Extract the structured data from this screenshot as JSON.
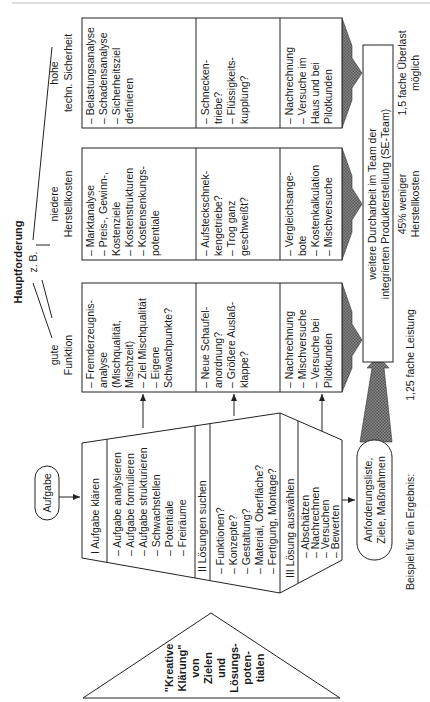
{
  "header": {
    "title": "Hauptforderung",
    "subtitle": "z. B."
  },
  "columns": [
    {
      "heading": [
        "hohe",
        "techn. Sicherheit"
      ],
      "row1": [
        "– Belastungsanalyse",
        "– Schadensanalyse",
        "– Sicherheitsziel",
        "   definieren"
      ],
      "row2": [
        "– Schnecken-",
        "   triebe?",
        "– Flüssigkeits-",
        "   kupplung?"
      ],
      "row3": [
        "– Nachrechnung",
        "– Versuche im",
        "   Haus und bei",
        "   Pilotkunden"
      ],
      "result": [
        "1,5 fache Überlast",
        "möglich"
      ]
    },
    {
      "heading": [
        "niedere",
        "Herstellkosten"
      ],
      "row1": [
        "– Marktanalyse",
        "– Preis-, Gewinn-,",
        "   Kostenziele",
        "– Kostenstrukturen",
        "– Kostensenkungs-",
        "   potentiale"
      ],
      "row2": [
        "– Aufsteckschnek-",
        "   kengetriebe?",
        "– Trog ganz",
        "   geschweißt?"
      ],
      "row3": [
        "– Vergleichsange-",
        "   bote",
        "– Kostenkalkulation",
        "– Mischversuche"
      ],
      "result": [
        "45% weniger",
        "Herstellkosten"
      ]
    },
    {
      "heading": [
        "gute",
        "Funktion"
      ],
      "row1": [
        "– Fremderzeugnis-",
        "   analyse",
        "   (Mischqualität,",
        "   Mischzeit)",
        "– Ziel Mischqualität",
        "– Eigene",
        "   Schwachpunkte?"
      ],
      "row2": [
        "– Neue Schaufel-",
        "   anordnung?",
        "– Größere Auslaß-",
        "   klappe?"
      ],
      "row3": [
        "– Nachrechnung",
        "– Mischversuche",
        "– Versuche bei",
        "   Pilotkunden"
      ],
      "result": [
        "1,25 fache Leistung"
      ]
    }
  ],
  "process": {
    "start": "Aufgabe",
    "phase1": {
      "title": "I    Aufgabe klären",
      "items": [
        "– Aufgabe analysieren",
        "– Aufgabe formulieren",
        "– Aufgabe strukturieren",
        "– Schwachstellen",
        "– Potentiale",
        "– Freiräume"
      ]
    },
    "phase2": {
      "title": "II   Lösungen suchen",
      "items": [
        "– Funktionen?",
        "– Konzepte?",
        "– Gestaltung?",
        "– Material, Oberfläche?",
        "– Fertigung, Montage?"
      ]
    },
    "phase3": {
      "title": "III Lösung auswählen",
      "items": [
        "– Abschätzen",
        "– Nachrechnen",
        "– Versuchen",
        "– Bewerten"
      ]
    },
    "output": [
      "Anforderungsliste,",
      "Ziele, Maßnahmen"
    ]
  },
  "triangle": [
    "\"Kreative",
    "Klärung\"",
    "von",
    "Zielen",
    "und",
    "Lösungs-",
    "poten-",
    "tialen"
  ],
  "team_box": [
    "weitere Durcharbeit im Team der",
    "integrierten Produkterstellung (SE-Team)"
  ],
  "result_label": "Beispiel für ein Ergebnis:",
  "colors": {
    "line": "#222222",
    "arrow_fill": "#7a7a7a",
    "background": "#ffffff"
  }
}
